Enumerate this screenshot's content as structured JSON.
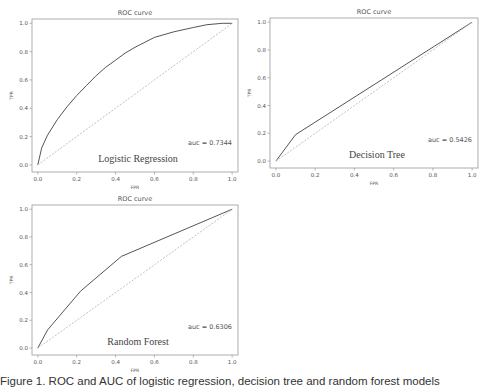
{
  "chart_data": [
    {
      "type": "line",
      "title": "ROC curve",
      "xlabel": "FPR",
      "ylabel": "TPR",
      "xlim": [
        -0.03,
        1.03
      ],
      "ylim": [
        -0.05,
        1.03
      ],
      "xticks": [
        "0.0",
        "0.2",
        "0.4",
        "0.6",
        "0.8",
        "1.0"
      ],
      "yticks": [
        "0.0",
        "0.2",
        "0.4",
        "0.6",
        "0.8",
        "1.0"
      ],
      "grid": false,
      "model_label": "Logistic Regression",
      "auc_text": "auc = 0.7344",
      "series": [
        {
          "name": "ROC",
          "style": "solid",
          "x": [
            0.0,
            0.02,
            0.05,
            0.1,
            0.15,
            0.2,
            0.25,
            0.3,
            0.35,
            0.4,
            0.45,
            0.5,
            0.6,
            0.7,
            0.8,
            0.87,
            0.95,
            1.0
          ],
          "y": [
            0.0,
            0.12,
            0.21,
            0.32,
            0.41,
            0.49,
            0.56,
            0.63,
            0.69,
            0.74,
            0.79,
            0.83,
            0.9,
            0.94,
            0.97,
            0.99,
            1.0,
            1.0
          ]
        },
        {
          "name": "chance",
          "style": "dashed",
          "x": [
            0.0,
            1.0
          ],
          "y": [
            0.0,
            1.0
          ]
        }
      ]
    },
    {
      "type": "line",
      "title": "ROC curve",
      "xlabel": "FPR",
      "ylabel": "TPR",
      "xlim": [
        -0.03,
        1.03
      ],
      "ylim": [
        -0.05,
        1.03
      ],
      "xticks": [
        "0.0",
        "0.2",
        "0.4",
        "0.6",
        "0.8",
        "1.0"
      ],
      "yticks": [
        "0.0",
        "0.2",
        "0.4",
        "0.6",
        "0.8",
        "1.0"
      ],
      "grid": false,
      "model_label": "Decision Tree",
      "auc_text": "auc = 0.5426",
      "series": [
        {
          "name": "ROC",
          "style": "solid",
          "x": [
            0.0,
            0.1,
            1.0
          ],
          "y": [
            0.0,
            0.19,
            1.0
          ]
        },
        {
          "name": "chance",
          "style": "dashed",
          "x": [
            0.0,
            1.0
          ],
          "y": [
            0.0,
            1.0
          ]
        }
      ]
    },
    {
      "type": "line",
      "title": "ROC curve",
      "xlabel": "FPR",
      "ylabel": "TPR",
      "xlim": [
        -0.03,
        1.03
      ],
      "ylim": [
        -0.05,
        1.03
      ],
      "xticks": [
        "0.0",
        "0.2",
        "0.4",
        "0.6",
        "0.8",
        "1.0"
      ],
      "yticks": [
        "0.0",
        "0.2",
        "0.4",
        "0.6",
        "0.8",
        "1.0"
      ],
      "grid": false,
      "model_label": "Random Forest",
      "auc_text": "auc = 0.6306",
      "series": [
        {
          "name": "ROC",
          "style": "solid",
          "x": [
            0.0,
            0.05,
            0.22,
            0.43,
            1.0
          ],
          "y": [
            0.0,
            0.13,
            0.41,
            0.66,
            1.0
          ]
        },
        {
          "name": "chance",
          "style": "dashed",
          "x": [
            0.0,
            1.0
          ],
          "y": [
            0.0,
            1.0
          ]
        }
      ]
    }
  ],
  "caption": "Figure 1. ROC and AUC of logistic regression, decision tree and random forest models",
  "colors": {
    "line": "#555555",
    "dashed": "#b0b0b0",
    "frame": "#999999",
    "text": "#555555",
    "model_label": "#444444"
  }
}
